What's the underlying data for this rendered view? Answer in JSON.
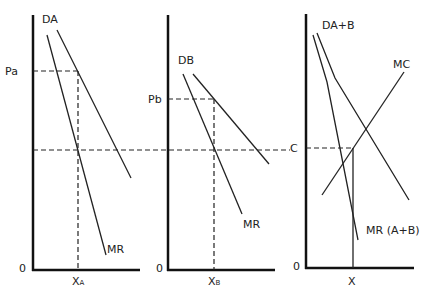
{
  "panels": [
    {
      "id": "market-a",
      "demand_label": "DA",
      "mr_label": "MR",
      "price_label": "Pa",
      "quantity_label_main": "X",
      "quantity_label_sub": "A",
      "origin_label": "0"
    },
    {
      "id": "market-b",
      "demand_label": "DB",
      "mr_label": "MR",
      "price_label": "Pb",
      "quantity_label_main": "X",
      "quantity_label_sub": "B",
      "origin_label": "0"
    },
    {
      "id": "combined-market",
      "demand_label": "DA+B",
      "mr_label": "MR (A+B)",
      "mc_label": "MC",
      "cost_label": "C",
      "quantity_label": "X",
      "origin_label": "0"
    }
  ],
  "colors": {
    "line": "#222222",
    "axis": "#111111",
    "background": "#ffffff"
  }
}
